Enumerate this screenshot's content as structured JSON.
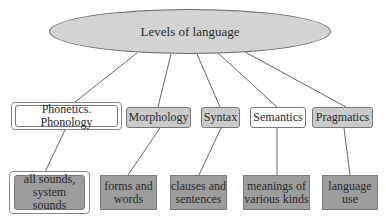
{
  "diagram": {
    "root": {
      "label": "Levels of language",
      "fill": "#d3d3d3"
    },
    "levels": [
      {
        "label": "Phonetics. Phonology",
        "style": "white-double",
        "detail": "all sounds, system sounds"
      },
      {
        "label": "Morphology",
        "style": "gray",
        "detail": "forms and words"
      },
      {
        "label": "Syntax",
        "style": "gray",
        "detail": "clauses and sentences"
      },
      {
        "label": "Semantics",
        "style": "white",
        "detail": "meanings of various kinds"
      },
      {
        "label": "Pragmatics",
        "style": "gray",
        "detail": "language use"
      }
    ],
    "details": [
      {
        "line1": "all sounds,",
        "line2": "system sounds"
      },
      {
        "line1": "forms and",
        "line2": "words"
      },
      {
        "line1": "clauses and",
        "line2": "sentences"
      },
      {
        "line1": "meanings of",
        "line2": "various kinds"
      },
      {
        "line1": "language",
        "line2": "use"
      }
    ],
    "colors": {
      "level_gray": "#cbcbcb",
      "leaf_gray": "#9d9d9d",
      "line": "#555555"
    }
  }
}
